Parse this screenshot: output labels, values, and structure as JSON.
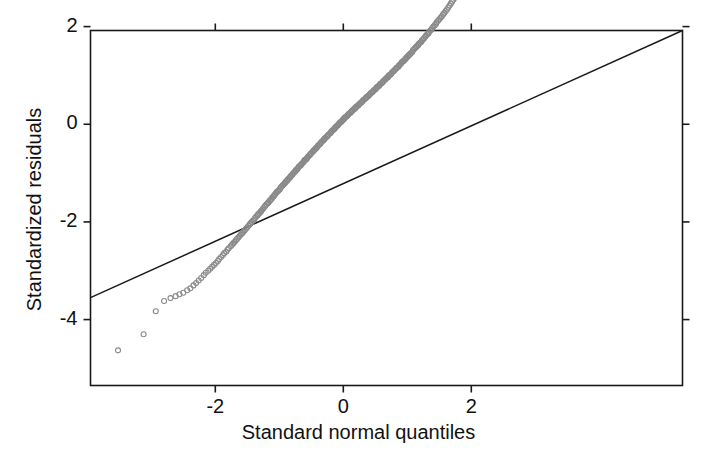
{
  "figure": {
    "width": 717,
    "height": 459,
    "background": "#ffffff",
    "frame_color": "#1a1a1a",
    "marker_color": "#8a8a8a",
    "line_color": "#1a1a1a"
  },
  "chart_data": {
    "type": "scatter",
    "title": "",
    "subtitle": "",
    "xlabel": "Standard normal quantiles",
    "ylabel": "Standardized residuals",
    "xlim": [
      -3.95,
      5.3
    ],
    "ylim": [
      -5.35,
      1.92
    ],
    "xticks": [
      -2,
      0,
      2
    ],
    "xticklabels": [
      "-2",
      "0",
      "2"
    ],
    "yticks": [
      2,
      0,
      -2,
      -4
    ],
    "yticklabels": [
      "2",
      "0",
      "-2",
      "-4"
    ],
    "grid": false,
    "legend": null,
    "annotations": [],
    "series": [
      {
        "name": "qq-points",
        "type": "scatter",
        "marker": "open-circle",
        "color": "#8a8a8a",
        "x": [
          -3.52,
          -3.12,
          -2.93,
          -2.8,
          -2.7,
          -2.62,
          -2.56,
          -2.5,
          -2.44,
          -2.39,
          -2.34,
          -2.3,
          -2.26,
          -2.22,
          -2.18,
          -2.15,
          -2.11,
          -2.08,
          -2.05,
          -2.02,
          -1.99,
          -1.96,
          -1.94,
          -1.91,
          -1.88,
          -1.86,
          -1.83,
          -1.81,
          -1.79,
          -1.76,
          -1.74,
          -1.72,
          -1.7,
          -1.68,
          -1.66,
          -1.64,
          -1.62,
          -1.6,
          -1.58,
          -1.56,
          -1.54,
          -1.52,
          -1.5,
          -1.48,
          -1.46,
          -1.45,
          -1.43,
          -1.41,
          -1.39,
          -1.38,
          -1.36,
          -1.34,
          -1.33,
          -1.31,
          -1.29,
          -1.28,
          -1.26,
          -1.25,
          -1.23,
          -1.22,
          -1.2,
          -1.18,
          -1.17,
          -1.15,
          -1.14,
          -1.12,
          -1.11,
          -1.09,
          -1.08,
          -1.07,
          -1.05,
          -1.04,
          -1.02,
          -1.01,
          -0.99,
          -0.98,
          -0.97,
          -0.95,
          -0.94,
          -0.92,
          -0.91,
          -0.9,
          -0.88,
          -0.87,
          -0.86,
          -0.84,
          -0.83,
          -0.82,
          -0.8,
          -0.79,
          -0.78,
          -0.76,
          -0.75,
          -0.74,
          -0.72,
          -0.71,
          -0.7,
          -0.69,
          -0.67,
          -0.66,
          -0.65,
          -0.63,
          -0.62,
          -0.61,
          -0.6,
          -0.58,
          -0.57,
          -0.56,
          -0.55,
          -0.53,
          -0.52,
          -0.51,
          -0.5,
          -0.48,
          -0.47,
          -0.46,
          -0.45,
          -0.43,
          -0.42,
          -0.41,
          -0.4,
          -0.39,
          -0.37,
          -0.36,
          -0.35,
          -0.34,
          -0.32,
          -0.31,
          -0.3,
          -0.29,
          -0.28,
          -0.26,
          -0.25,
          -0.24,
          -0.23,
          -0.21,
          -0.2,
          -0.19,
          -0.18,
          -0.17,
          -0.15,
          -0.14,
          -0.13,
          -0.12,
          -0.11,
          -0.09,
          -0.08,
          -0.07,
          -0.06,
          -0.05,
          -0.03,
          -0.02,
          -0.01,
          0.0,
          0.01,
          0.02,
          0.03,
          0.05,
          0.06,
          0.07,
          0.08,
          0.09,
          0.11,
          0.12,
          0.13,
          0.14,
          0.15,
          0.17,
          0.18,
          0.19,
          0.2,
          0.21,
          0.23,
          0.24,
          0.25,
          0.26,
          0.28,
          0.29,
          0.3,
          0.31,
          0.32,
          0.34,
          0.35,
          0.36,
          0.37,
          0.39,
          0.4,
          0.41,
          0.42,
          0.43,
          0.45,
          0.46,
          0.47,
          0.48,
          0.5,
          0.51,
          0.52,
          0.53,
          0.55,
          0.56,
          0.57,
          0.58,
          0.6,
          0.61,
          0.62,
          0.63,
          0.65,
          0.66,
          0.67,
          0.69,
          0.7,
          0.71,
          0.72,
          0.74,
          0.75,
          0.76,
          0.78,
          0.79,
          0.8,
          0.82,
          0.83,
          0.84,
          0.86,
          0.87,
          0.88,
          0.9,
          0.91,
          0.92,
          0.94,
          0.95,
          0.97,
          0.98,
          0.99,
          1.01,
          1.02,
          1.04,
          1.05,
          1.07,
          1.08,
          1.09,
          1.11,
          1.12,
          1.14,
          1.15,
          1.17,
          1.18,
          1.2,
          1.22,
          1.23,
          1.25,
          1.26,
          1.28,
          1.29,
          1.31,
          1.33,
          1.34,
          1.36,
          1.38,
          1.39,
          1.41,
          1.43,
          1.45,
          1.46,
          1.48,
          1.5,
          1.52,
          1.54,
          1.56,
          1.58,
          1.6,
          1.62,
          1.64,
          1.66,
          1.68,
          1.7,
          1.72,
          1.74,
          1.76,
          1.79,
          1.81,
          1.83,
          1.86,
          1.88,
          1.91,
          1.94,
          1.96,
          1.99,
          2.02,
          2.05,
          2.08,
          2.11,
          2.15,
          2.18,
          2.22,
          2.26,
          2.3,
          2.34,
          2.39,
          2.44,
          2.5,
          2.56,
          2.62,
          2.7,
          2.8,
          2.93,
          3.12,
          3.22,
          3.35,
          3.52
        ],
        "y": [
          -4.63,
          -4.3,
          -3.83,
          -3.62,
          -3.56,
          -3.52,
          -3.48,
          -3.45,
          -3.4,
          -3.36,
          -3.3,
          -3.25,
          -3.2,
          -3.15,
          -3.09,
          -3.04,
          -3.0,
          -2.96,
          -2.92,
          -2.88,
          -2.84,
          -2.8,
          -2.76,
          -2.72,
          -2.68,
          -2.64,
          -2.61,
          -2.57,
          -2.54,
          -2.5,
          -2.47,
          -2.44,
          -2.41,
          -2.38,
          -2.35,
          -2.32,
          -2.29,
          -2.26,
          -2.23,
          -2.2,
          -2.17,
          -2.14,
          -2.11,
          -2.08,
          -2.05,
          -2.03,
          -2.0,
          -1.97,
          -1.95,
          -1.92,
          -1.89,
          -1.87,
          -1.84,
          -1.82,
          -1.79,
          -1.77,
          -1.74,
          -1.72,
          -1.69,
          -1.67,
          -1.64,
          -1.62,
          -1.6,
          -1.57,
          -1.55,
          -1.53,
          -1.5,
          -1.48,
          -1.46,
          -1.44,
          -1.41,
          -1.39,
          -1.37,
          -1.35,
          -1.33,
          -1.3,
          -1.28,
          -1.26,
          -1.24,
          -1.22,
          -1.2,
          -1.18,
          -1.16,
          -1.14,
          -1.12,
          -1.1,
          -1.08,
          -1.06,
          -1.04,
          -1.02,
          -1.0,
          -0.98,
          -0.96,
          -0.94,
          -0.92,
          -0.9,
          -0.88,
          -0.86,
          -0.85,
          -0.83,
          -0.81,
          -0.79,
          -0.77,
          -0.75,
          -0.73,
          -0.72,
          -0.7,
          -0.68,
          -0.66,
          -0.64,
          -0.62,
          -0.61,
          -0.59,
          -0.57,
          -0.55,
          -0.54,
          -0.52,
          -0.5,
          -0.48,
          -0.47,
          -0.45,
          -0.43,
          -0.41,
          -0.4,
          -0.38,
          -0.36,
          -0.34,
          -0.33,
          -0.31,
          -0.29,
          -0.28,
          -0.26,
          -0.24,
          -0.23,
          -0.21,
          -0.19,
          -0.18,
          -0.16,
          -0.14,
          -0.13,
          -0.11,
          -0.09,
          -0.08,
          -0.06,
          -0.04,
          -0.03,
          -0.01,
          0.01,
          0.02,
          0.04,
          0.05,
          0.07,
          0.08,
          0.1,
          0.11,
          0.13,
          0.14,
          0.16,
          0.17,
          0.19,
          0.2,
          0.22,
          0.23,
          0.25,
          0.26,
          0.28,
          0.29,
          0.31,
          0.32,
          0.34,
          0.35,
          0.37,
          0.38,
          0.4,
          0.41,
          0.43,
          0.44,
          0.46,
          0.47,
          0.49,
          0.5,
          0.52,
          0.53,
          0.55,
          0.56,
          0.58,
          0.59,
          0.61,
          0.62,
          0.64,
          0.65,
          0.67,
          0.68,
          0.7,
          0.71,
          0.73,
          0.75,
          0.76,
          0.78,
          0.79,
          0.81,
          0.83,
          0.84,
          0.86,
          0.87,
          0.89,
          0.91,
          0.92,
          0.94,
          0.96,
          0.97,
          0.99,
          1.01,
          1.02,
          1.04,
          1.06,
          1.08,
          1.09,
          1.11,
          1.13,
          1.15,
          1.16,
          1.18,
          1.2,
          1.22,
          1.24,
          1.26,
          1.28,
          1.29,
          1.31,
          1.33,
          1.35,
          1.37,
          1.39,
          1.41,
          1.43,
          1.45,
          1.47,
          1.49,
          1.52,
          1.54,
          1.56,
          1.58,
          1.6,
          1.62,
          1.65,
          1.67,
          1.69,
          1.72,
          1.74,
          1.76,
          1.79,
          1.81,
          1.84,
          1.86,
          1.89,
          1.92,
          1.94,
          1.97,
          2.0,
          2.03,
          2.06,
          2.09,
          2.12,
          2.15,
          2.18,
          2.21,
          2.25,
          2.28,
          2.32,
          2.35,
          2.39,
          2.43,
          2.47,
          2.51,
          2.55,
          2.59,
          2.63,
          2.68,
          2.72,
          2.77,
          2.82,
          2.87,
          2.92,
          2.97,
          3.0,
          3.03,
          3.06,
          3.1,
          3.13,
          3.17,
          3.21,
          3.25,
          3.3,
          3.34,
          3.39,
          3.44,
          3.5,
          3.52,
          3.48,
          3.42,
          3.36,
          3.3,
          3.26,
          3.3,
          3.23,
          3.1,
          3.3,
          3.22
        ]
      },
      {
        "name": "reference-line",
        "type": "line",
        "color": "#1a1a1a",
        "x": [
          -3.95,
          5.3
        ],
        "y": [
          -3.55,
          1.92
        ]
      }
    ]
  },
  "axes": {
    "x_axis_label": "Standard normal quantiles",
    "y_axis_label": "Standardized residuals",
    "x_tick_labels": [
      "-2",
      "0",
      "2"
    ],
    "y_tick_labels": [
      "2",
      "0",
      "-2",
      "-4"
    ]
  }
}
